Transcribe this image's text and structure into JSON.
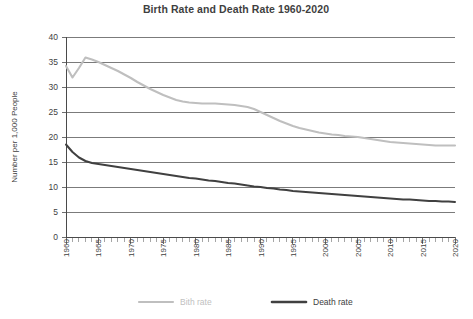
{
  "chart_data": {
    "type": "line",
    "title": "Birth Rate and Death Rate 1960-2020",
    "xlabel": "",
    "ylabel": "Number per 1,000 People",
    "xlim": [
      1960,
      2020
    ],
    "ylim": [
      0,
      40
    ],
    "y_ticks": [
      0,
      5,
      10,
      15,
      20,
      25,
      30,
      35,
      40
    ],
    "x_ticks": [
      1960,
      1965,
      1970,
      1975,
      1980,
      1985,
      1990,
      1995,
      2000,
      2005,
      2010,
      2015,
      2020
    ],
    "x_minor_step": 1,
    "grid": true,
    "legend_position": "bottom",
    "colors": {
      "birth_rate": "#bfbfbf",
      "death_rate": "#404040",
      "grid": "#5a5a5a",
      "axis": "#4a4a4a",
      "text": "#3f3f3f"
    },
    "x": [
      1960,
      1961,
      1962,
      1963,
      1964,
      1965,
      1966,
      1967,
      1968,
      1969,
      1970,
      1971,
      1972,
      1973,
      1974,
      1975,
      1976,
      1977,
      1978,
      1979,
      1980,
      1981,
      1982,
      1983,
      1984,
      1985,
      1986,
      1987,
      1988,
      1989,
      1990,
      1991,
      1992,
      1993,
      1994,
      1995,
      1996,
      1997,
      1998,
      1999,
      2000,
      2001,
      2002,
      2003,
      2004,
      2005,
      2006,
      2007,
      2008,
      2009,
      2010,
      2011,
      2012,
      2013,
      2014,
      2015,
      2016,
      2017,
      2018,
      2019,
      2020
    ],
    "series": [
      {
        "name": "Bith rate",
        "key": "birth_rate",
        "color": "#bfbfbf",
        "width": 2.1,
        "values": [
          34.2,
          31.9,
          33.8,
          35.9,
          35.5,
          35.0,
          34.4,
          33.8,
          33.2,
          32.5,
          31.8,
          31.0,
          30.3,
          29.6,
          29.0,
          28.4,
          27.9,
          27.4,
          27.1,
          26.9,
          26.8,
          26.7,
          26.7,
          26.7,
          26.6,
          26.5,
          26.4,
          26.2,
          26.0,
          25.6,
          25.0,
          24.4,
          23.8,
          23.2,
          22.7,
          22.2,
          21.8,
          21.5,
          21.2,
          20.9,
          20.7,
          20.5,
          20.4,
          20.2,
          20.1,
          20.0,
          19.8,
          19.6,
          19.4,
          19.2,
          19.0,
          18.9,
          18.8,
          18.7,
          18.6,
          18.5,
          18.4,
          18.3,
          18.3,
          18.3,
          18.3
        ]
      },
      {
        "name": "Death rate",
        "key": "death_rate",
        "color": "#404040",
        "width": 2.0,
        "values": [
          18.5,
          17.0,
          15.9,
          15.2,
          14.8,
          14.6,
          14.4,
          14.2,
          14.0,
          13.8,
          13.6,
          13.4,
          13.2,
          13.0,
          12.8,
          12.6,
          12.4,
          12.2,
          12.0,
          11.8,
          11.7,
          11.5,
          11.3,
          11.2,
          11.0,
          10.8,
          10.7,
          10.5,
          10.3,
          10.1,
          10.0,
          9.8,
          9.7,
          9.5,
          9.4,
          9.2,
          9.1,
          9.0,
          8.9,
          8.8,
          8.7,
          8.6,
          8.5,
          8.4,
          8.3,
          8.2,
          8.1,
          8.0,
          7.9,
          7.8,
          7.7,
          7.6,
          7.5,
          7.5,
          7.4,
          7.3,
          7.2,
          7.2,
          7.1,
          7.1,
          7.0
        ]
      }
    ],
    "legend": [
      {
        "label": "Bith rate",
        "color": "#bfbfbf"
      },
      {
        "label": "Death rate",
        "color": "#404040"
      }
    ]
  }
}
